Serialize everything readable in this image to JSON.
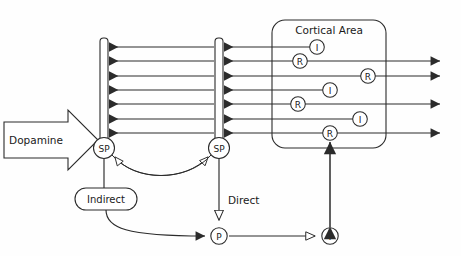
{
  "figure": {
    "background_color": "#fefefe",
    "line_color": "#2b2b2b",
    "text_color": "#1a1a1a"
  },
  "labels": {
    "dopamine": "Dopamine",
    "cortical_area": "Cortical Area",
    "indirect": "Indirect",
    "direct": "Direct"
  },
  "nodes": {
    "striatal_left": {
      "label": "SP",
      "x": 104,
      "y": 148
    },
    "striatal_right": {
      "label": "SP",
      "x": 219,
      "y": 148
    },
    "pallidum": {
      "label": "P",
      "x": 219,
      "y": 236
    },
    "thalamus": {
      "label": "T",
      "x": 330,
      "y": 236
    }
  },
  "cortical_nodes": [
    {
      "label": "I",
      "row": 1,
      "x": 317,
      "y": 47
    },
    {
      "label": "R",
      "row": 2,
      "x": 300,
      "y": 61
    },
    {
      "label": "R",
      "row": 3,
      "x": 368,
      "y": 76
    },
    {
      "label": "I",
      "row": 4,
      "x": 330,
      "y": 90
    },
    {
      "label": "R",
      "row": 5,
      "x": 298,
      "y": 104
    },
    {
      "label": "I",
      "row": 6,
      "x": 360,
      "y": 119
    },
    {
      "label": "R",
      "row": 7,
      "x": 330,
      "y": 133
    }
  ],
  "rows": {
    "count": 7,
    "y_values": [
      47,
      61,
      76,
      90,
      104,
      119,
      133
    ],
    "output_arrow_rows": [
      2,
      3,
      5,
      7
    ]
  },
  "bars": {
    "left_bar_x": 104,
    "right_bar_x": 219,
    "top_y": 38,
    "bottom_y": 142
  },
  "cortical_box": {
    "x": 272,
    "y": 20,
    "width": 114,
    "height": 128
  },
  "connections": [
    {
      "from": "dopamine",
      "to": "striatal_bars",
      "style": "block-arrow"
    },
    {
      "from": "striatal_left",
      "to": "striatal_right",
      "style": "curve-hollow-arrow"
    },
    {
      "from": "striatal_right",
      "to": "striatal_left",
      "style": "curve-hollow-arrow"
    },
    {
      "from": "striatal_left",
      "to": "indirect",
      "style": "line"
    },
    {
      "from": "indirect",
      "to": "pallidum",
      "style": "curve-solid-arrow"
    },
    {
      "from": "striatal_right",
      "to": "pallidum",
      "style": "line-hollow-arrow",
      "label": "Direct"
    },
    {
      "from": "pallidum",
      "to": "thalamus",
      "style": "line-hollow-arrow"
    },
    {
      "from": "thalamus",
      "to": "cortical_R_row7",
      "style": "double-solid-arrow"
    }
  ]
}
